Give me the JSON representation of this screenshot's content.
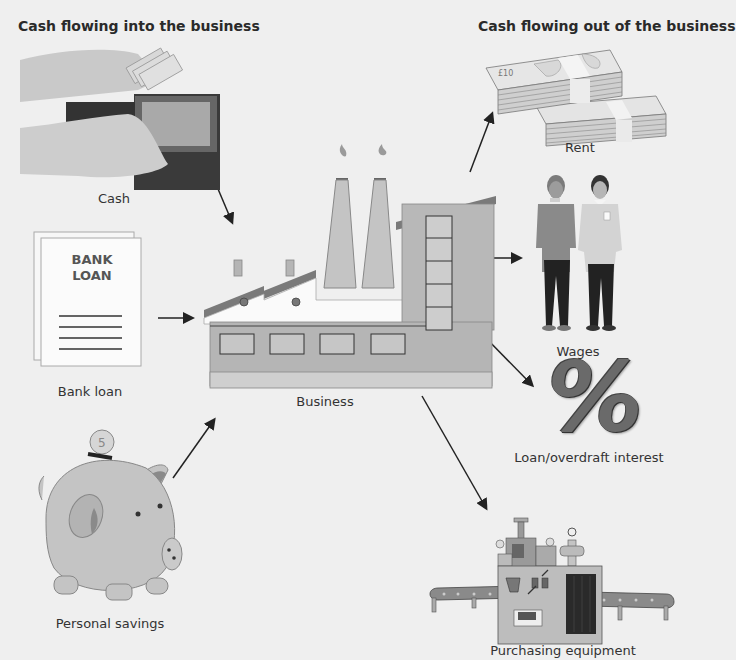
{
  "headings": {
    "inflow": "Cash flowing into the business",
    "outflow": "Cash flowing out of the business"
  },
  "inflows": [
    {
      "label": "Cash",
      "icon": "wallet-with-cash-icon"
    },
    {
      "label": "Bank loan",
      "icon": "bank-loan-document-icon",
      "document_text": [
        "BANK",
        "LOAN"
      ]
    },
    {
      "label": "Personal savings",
      "icon": "piggy-bank-icon"
    }
  ],
  "center": {
    "label": "Business",
    "icon": "factory-icon"
  },
  "outflows": [
    {
      "label": "Rent",
      "icon": "banknote-stacks-icon"
    },
    {
      "label": "Wages",
      "icon": "workers-icon"
    },
    {
      "label": "Loan/overdraft interest",
      "icon": "percent-icon",
      "symbol": "%"
    },
    {
      "label": "Purchasing equipment",
      "icon": "industrial-machine-icon"
    }
  ],
  "colors": {
    "background": "#efefef",
    "figure_gray": "#bdbdbd",
    "dark_gray": "#6e6e6e",
    "outline": "#3a3a3a",
    "arrow": "#222222"
  }
}
